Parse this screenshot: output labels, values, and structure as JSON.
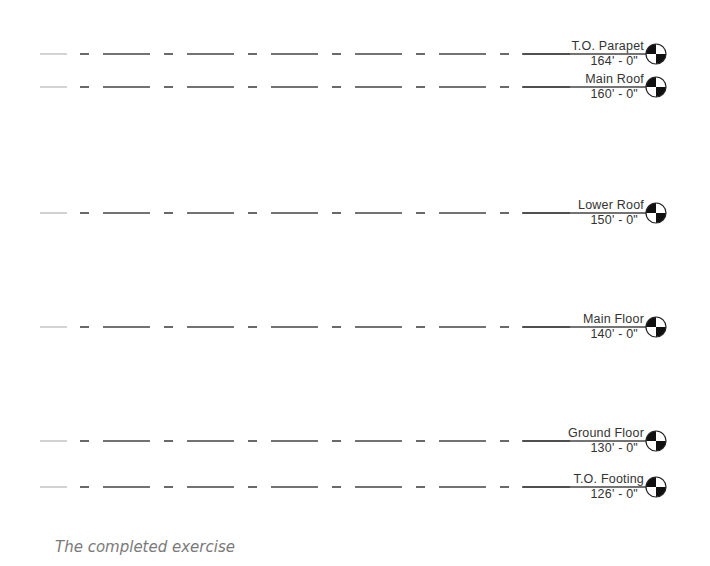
{
  "diagram": {
    "type": "building-level-elevations",
    "line_color": "#444444",
    "levels": [
      {
        "name": "T.O. Parapet",
        "elevation": "164' - 0\"",
        "y": 54
      },
      {
        "name": "Main Roof",
        "elevation": "160' - 0\"",
        "y": 87
      },
      {
        "name": "Lower Roof",
        "elevation": "150' - 0\"",
        "y": 213
      },
      {
        "name": "Main Floor",
        "elevation": "140' - 0\"",
        "y": 327
      },
      {
        "name": "Ground Floor",
        "elevation": "130' - 0\"",
        "y": 441
      },
      {
        "name": "T.O. Footing",
        "elevation": "126' - 0\"",
        "y": 487
      }
    ]
  },
  "caption": "The completed exercise"
}
